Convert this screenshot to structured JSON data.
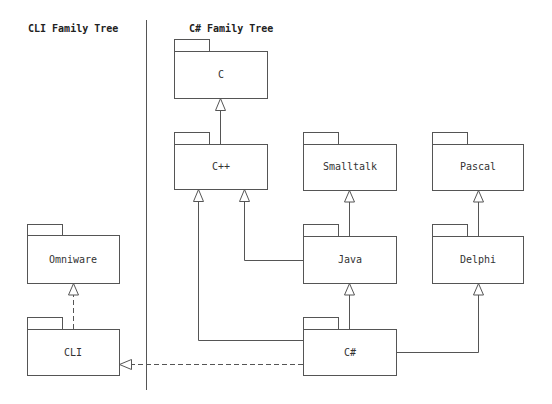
{
  "diagram": {
    "type": "uml-package-inheritance",
    "sections": {
      "left": {
        "title": "CLI Family Tree"
      },
      "right": {
        "title": "C# Family Tree"
      }
    },
    "colors": {
      "line": "#555555",
      "text": "#333333",
      "background": "#ffffff"
    },
    "packages": [
      {
        "id": "c",
        "label": "C"
      },
      {
        "id": "cpp",
        "label": "C++"
      },
      {
        "id": "smalltalk",
        "label": "Smalltalk"
      },
      {
        "id": "pascal",
        "label": "Pascal"
      },
      {
        "id": "java",
        "label": "Java"
      },
      {
        "id": "delphi",
        "label": "Delphi"
      },
      {
        "id": "csharp",
        "label": "C#"
      },
      {
        "id": "omniware",
        "label": "Omniware"
      },
      {
        "id": "cli",
        "label": "CLI"
      }
    ],
    "relations": [
      {
        "from": "C++",
        "to": "C",
        "style": "solid",
        "kind": "generalization"
      },
      {
        "from": "Java",
        "to": "Smalltalk",
        "style": "solid",
        "kind": "generalization"
      },
      {
        "from": "Java",
        "to": "C++",
        "style": "solid",
        "kind": "generalization"
      },
      {
        "from": "Delphi",
        "to": "Pascal",
        "style": "solid",
        "kind": "generalization"
      },
      {
        "from": "C#",
        "to": "Java",
        "style": "solid",
        "kind": "generalization"
      },
      {
        "from": "C#",
        "to": "C++",
        "style": "solid",
        "kind": "generalization"
      },
      {
        "from": "C#",
        "to": "Delphi",
        "style": "solid",
        "kind": "generalization"
      },
      {
        "from": "C#",
        "to": "CLI",
        "style": "dashed",
        "kind": "realization"
      },
      {
        "from": "CLI",
        "to": "Omniware",
        "style": "dashed",
        "kind": "realization"
      }
    ]
  }
}
